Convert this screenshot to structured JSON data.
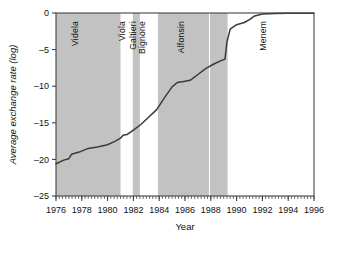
{
  "chart_data": {
    "type": "line",
    "title": "",
    "xlabel": "Year",
    "ylabel": "Average exchange rate (log)",
    "xlim": [
      1976,
      1996
    ],
    "ylim": [
      -25,
      0
    ],
    "xticks": [
      1976,
      1978,
      1980,
      1982,
      1984,
      1986,
      1988,
      1990,
      1992,
      1994,
      1996
    ],
    "xtick_labels": [
      "1976",
      "1978",
      "1980",
      "1982",
      "1984",
      "1986",
      "1988",
      "1990",
      "1992",
      "1994",
      "1996"
    ],
    "yticks": [
      0,
      -5,
      -10,
      -15,
      -20,
      -25
    ],
    "ytick_labels": [
      "0",
      "-5",
      "-10",
      "-15",
      "-20",
      "-25"
    ],
    "minor_xticks": true,
    "grid": false,
    "legend": "none",
    "line_color": "#3a3a3a",
    "band_color": "#c2c2c2",
    "series": [
      {
        "name": "Average exchange rate (log)",
        "x": [
          1976.0,
          1976.6,
          1977.0,
          1977.2,
          1977.8,
          1978.5,
          1979.2,
          1980.0,
          1980.6,
          1981.0,
          1981.2,
          1981.5,
          1982.0,
          1982.6,
          1983.2,
          1983.8,
          1984.4,
          1985.0,
          1985.4,
          1985.8,
          1986.4,
          1987.0,
          1987.6,
          1988.2,
          1988.8,
          1989.1,
          1989.25,
          1989.5,
          1990.0,
          1990.6,
          1991.0,
          1991.4,
          1992.0,
          1993.0,
          1994.0,
          1995.0,
          1996.0
        ],
        "y": [
          -20.6,
          -20.1,
          -19.9,
          -19.3,
          -19.0,
          -18.5,
          -18.3,
          -18.0,
          -17.5,
          -17.1,
          -16.7,
          -16.6,
          -16.0,
          -15.2,
          -14.2,
          -13.2,
          -11.6,
          -10.1,
          -9.5,
          -9.4,
          -9.2,
          -8.4,
          -7.6,
          -7.0,
          -6.5,
          -6.3,
          -4.0,
          -2.2,
          -1.6,
          -1.3,
          -0.9,
          -0.4,
          -0.15,
          -0.08,
          -0.05,
          -0.03,
          -0.02
        ]
      }
    ],
    "regime_bands": [
      {
        "label": "Videla",
        "start": 1976.0,
        "end": 1981.0,
        "shaded": true
      },
      {
        "label": "Viola",
        "start": 1981.0,
        "end": 1981.95,
        "shaded": false
      },
      {
        "label": "Galtieri",
        "start": 1981.95,
        "end": 1982.5,
        "shaded": true
      },
      {
        "label": "Bignone",
        "start": 1982.5,
        "end": 1983.9,
        "shaded": false
      },
      {
        "label": "Alfonsin",
        "start": 1983.9,
        "end": 1989.3,
        "shaded": true
      },
      {
        "label": "Menem",
        "start": 1989.3,
        "end": 1996.0,
        "shaded": false
      }
    ],
    "band_divider_year": 1987.9
  }
}
